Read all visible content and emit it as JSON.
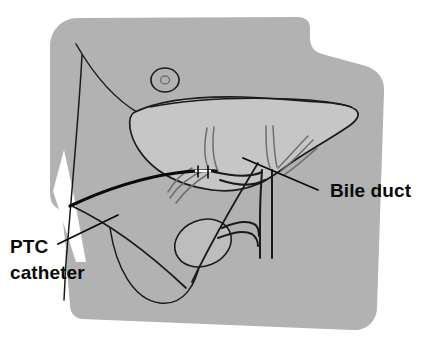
{
  "figure": {
    "type": "medical-line-illustration",
    "canvas": {
      "width": 423,
      "height": 348,
      "background": "#ffffff"
    }
  },
  "colors": {
    "background": "#ffffff",
    "torso_fill": "#b2b2b2",
    "liver_fill": "#c6c6c6",
    "gallbladder_fill": "#bdbdbd",
    "outline": "#1a1a1a",
    "duct_line": "#6e6e6e",
    "catheter": "#0a0a0a",
    "label_text": "#0a0a0a",
    "leader_line": "#0a0a0a"
  },
  "labels": [
    {
      "id": "bile-duct",
      "text": "Bile duct",
      "lines": [
        "Bile duct"
      ],
      "x": 330,
      "y": 197,
      "anchor": "start",
      "leader": {
        "x1": 318,
        "y1": 190,
        "x2": 243,
        "y2": 158
      }
    },
    {
      "id": "ptc-catheter",
      "text": "PTC catheter",
      "lines": [
        "PTC",
        "catheter"
      ],
      "x": 10,
      "y": 253,
      "line_height": 26,
      "anchor": "start",
      "leader": {
        "x1": 58,
        "y1": 244,
        "x2": 118,
        "y2": 215
      }
    }
  ],
  "anatomy": [
    {
      "id": "torso",
      "name": "torso-body-outline",
      "description": "Gray shaded upper abdomen and chest silhouette with rounded upper-left corner and shoulder notch at upper right"
    },
    {
      "id": "nipple",
      "name": "nipple-marker",
      "description": "Small double circle on chest wall"
    },
    {
      "id": "liver",
      "name": "liver",
      "description": "Large wedge-shaped liver occupying the center, lighter gray than torso"
    },
    {
      "id": "costal-margin",
      "name": "costal-margin",
      "description": "U-shaped rib margin curve at lower abdomen"
    },
    {
      "id": "arm-notch",
      "name": "arm-notch",
      "description": "White wedge gap at left side between arm and torso"
    },
    {
      "id": "bile-ducts",
      "name": "intrahepatic-bile-ducts",
      "description": "Branching biliary tree within liver converging to common bile duct"
    },
    {
      "id": "common-bile-duct",
      "name": "common-bile-duct",
      "description": "Vertical duct descending from hepatic duct confluence"
    },
    {
      "id": "cystic-duct",
      "name": "cystic-duct",
      "description": "Duct joining gallbladder to common bile duct"
    },
    {
      "id": "gallbladder",
      "name": "gallbladder",
      "description": "Oval sac below the liver on the left of the common duct"
    },
    {
      "id": "catheter",
      "name": "ptc-catheter-line",
      "description": "Thick black catheter entering through the right flank and advancing into the intrahepatic ducts"
    }
  ]
}
